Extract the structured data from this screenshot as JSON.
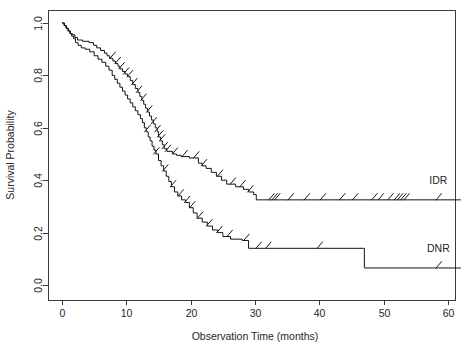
{
  "figure": {
    "background_color": "#ffffff",
    "line_color": "#151515",
    "axis_color": "#3c3c3c",
    "text_color": "#262626"
  },
  "chart_data": {
    "type": "line",
    "title": "",
    "subtitle": "",
    "xlabel": "Observation Time (months)",
    "ylabel": "Survival Probability",
    "xlim": [
      0,
      62
    ],
    "ylim": [
      0.0,
      1.0
    ],
    "xticks": [
      0,
      10,
      20,
      30,
      40,
      50,
      60
    ],
    "xtick_labels": [
      "0",
      "10",
      "20",
      "30",
      "40",
      "50",
      "60"
    ],
    "yticks": [
      0.0,
      0.2,
      0.4,
      0.6,
      0.8,
      1.0
    ],
    "ytick_labels": [
      "0.0",
      "0.2",
      "0.4",
      "0.6",
      "0.8",
      "1.0"
    ],
    "grid": false,
    "legend_position": "inline-right-end",
    "annotations": [
      {
        "text": "IDR",
        "x": 58.5,
        "y": 0.385
      },
      {
        "text": "DNR",
        "x": 58.5,
        "y": 0.125
      }
    ],
    "series": [
      {
        "name": "IDR",
        "label": "IDR",
        "step": "post",
        "points": [
          [
            0.0,
            1.0
          ],
          [
            0.4,
            0.99
          ],
          [
            0.7,
            0.98
          ],
          [
            1.0,
            0.97
          ],
          [
            1.3,
            0.96
          ],
          [
            1.6,
            0.955
          ],
          [
            2.0,
            0.945
          ],
          [
            2.4,
            0.935
          ],
          [
            3.2,
            0.93
          ],
          [
            4.2,
            0.925
          ],
          [
            4.9,
            0.915
          ],
          [
            5.4,
            0.905
          ],
          [
            6.0,
            0.895
          ],
          [
            6.6,
            0.885
          ],
          [
            7.0,
            0.875
          ],
          [
            7.4,
            0.865
          ],
          [
            7.9,
            0.855
          ],
          [
            8.3,
            0.845
          ],
          [
            8.7,
            0.835
          ],
          [
            9.0,
            0.825
          ],
          [
            9.4,
            0.815
          ],
          [
            9.8,
            0.805
          ],
          [
            10.2,
            0.795
          ],
          [
            10.6,
            0.78
          ],
          [
            11.0,
            0.765
          ],
          [
            11.4,
            0.75
          ],
          [
            11.8,
            0.735
          ],
          [
            12.1,
            0.72
          ],
          [
            12.4,
            0.705
          ],
          [
            12.7,
            0.69
          ],
          [
            13.0,
            0.675
          ],
          [
            13.3,
            0.66
          ],
          [
            13.6,
            0.645
          ],
          [
            13.9,
            0.63
          ],
          [
            14.2,
            0.615
          ],
          [
            14.5,
            0.6
          ],
          [
            14.8,
            0.585
          ],
          [
            15.0,
            0.565
          ],
          [
            15.3,
            0.55
          ],
          [
            15.6,
            0.535
          ],
          [
            15.9,
            0.52
          ],
          [
            16.3,
            0.51
          ],
          [
            17.2,
            0.5
          ],
          [
            17.8,
            0.495
          ],
          [
            18.5,
            0.49
          ],
          [
            19.8,
            0.485
          ],
          [
            20.6,
            0.485
          ],
          [
            21.2,
            0.465
          ],
          [
            21.8,
            0.455
          ],
          [
            22.4,
            0.445
          ],
          [
            23.2,
            0.43
          ],
          [
            24.0,
            0.415
          ],
          [
            24.8,
            0.4
          ],
          [
            25.6,
            0.385
          ],
          [
            27.0,
            0.375
          ],
          [
            28.2,
            0.365
          ],
          [
            29.0,
            0.355
          ],
          [
            29.8,
            0.345
          ],
          [
            30.2,
            0.325
          ],
          [
            62.0,
            0.325
          ]
        ],
        "censor_times": [
          7.8,
          8.6,
          9.2,
          9.9,
          10.5,
          11.2,
          11.9,
          12.6,
          13.5,
          14.2,
          14.8,
          15.2,
          15.5,
          15.9,
          16.4,
          17.5,
          19.0,
          20.8,
          22.0,
          24.5,
          26.5,
          28.0,
          29.2,
          32.5,
          33.0,
          33.4,
          35.5,
          38.0,
          40.5,
          43.5,
          45.5,
          48.5,
          49.5,
          51.0,
          52.0,
          52.5,
          53.0,
          53.5,
          58.5
        ],
        "plateau_value": 0.325,
        "plateau_start_month": 30.2,
        "end_month": 62.0
      },
      {
        "name": "DNR",
        "label": "DNR",
        "step": "post",
        "points": [
          [
            0.0,
            1.0
          ],
          [
            0.3,
            0.99
          ],
          [
            0.6,
            0.98
          ],
          [
            0.9,
            0.97
          ],
          [
            1.2,
            0.96
          ],
          [
            1.5,
            0.95
          ],
          [
            1.8,
            0.94
          ],
          [
            2.1,
            0.925
          ],
          [
            2.5,
            0.915
          ],
          [
            3.0,
            0.905
          ],
          [
            3.6,
            0.9
          ],
          [
            4.3,
            0.89
          ],
          [
            5.0,
            0.875
          ],
          [
            5.6,
            0.862
          ],
          [
            6.2,
            0.85
          ],
          [
            6.8,
            0.835
          ],
          [
            7.3,
            0.82
          ],
          [
            7.8,
            0.8
          ],
          [
            8.2,
            0.785
          ],
          [
            8.6,
            0.77
          ],
          [
            9.0,
            0.755
          ],
          [
            9.4,
            0.74
          ],
          [
            9.8,
            0.725
          ],
          [
            10.2,
            0.71
          ],
          [
            10.6,
            0.695
          ],
          [
            11.0,
            0.68
          ],
          [
            11.4,
            0.665
          ],
          [
            11.8,
            0.65
          ],
          [
            12.2,
            0.635
          ],
          [
            12.5,
            0.62
          ],
          [
            12.8,
            0.6
          ],
          [
            13.1,
            0.585
          ],
          [
            13.4,
            0.565
          ],
          [
            13.7,
            0.55
          ],
          [
            14.0,
            0.53
          ],
          [
            14.3,
            0.515
          ],
          [
            14.6,
            0.5
          ],
          [
            15.0,
            0.475
          ],
          [
            15.4,
            0.455
          ],
          [
            15.8,
            0.435
          ],
          [
            16.2,
            0.415
          ],
          [
            16.6,
            0.395
          ],
          [
            17.0,
            0.375
          ],
          [
            17.5,
            0.355
          ],
          [
            18.0,
            0.34
          ],
          [
            18.6,
            0.325
          ],
          [
            19.2,
            0.315
          ],
          [
            19.8,
            0.295
          ],
          [
            20.4,
            0.275
          ],
          [
            21.0,
            0.255
          ],
          [
            21.8,
            0.24
          ],
          [
            22.6,
            0.225
          ],
          [
            23.4,
            0.21
          ],
          [
            24.2,
            0.2
          ],
          [
            25.0,
            0.185
          ],
          [
            26.2,
            0.175
          ],
          [
            28.0,
            0.17
          ],
          [
            29.0,
            0.14
          ],
          [
            46.8,
            0.14
          ],
          [
            47.0,
            0.065
          ],
          [
            62.0,
            0.065
          ]
        ],
        "censor_times": [
          13.2,
          14.6,
          16.0,
          17.2,
          18.4,
          19.4,
          20.2,
          21.4,
          22.8,
          24.4,
          26.0,
          28.6,
          30.5,
          32.0,
          40.0,
          58.5
        ],
        "plateau_value": 0.14,
        "plateau_start_month": 29.0,
        "drop_month": 47.0,
        "final_value": 0.065,
        "end_month": 62.0
      }
    ]
  }
}
